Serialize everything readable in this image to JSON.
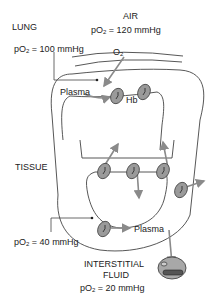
{
  "diagram": {
    "labels": {
      "lung": "LUNG",
      "air": "AIR",
      "air_po2_prefix": "pO",
      "air_po2_sub": "2",
      "air_po2_value": " = 120 mmHg",
      "lung_po2_prefix": "pO",
      "lung_po2_sub": "2",
      "lung_po2_value": " = 100 mmHg",
      "o2_prefix": "O",
      "o2_sub": "2",
      "plasma_top": "Plasma",
      "hb": "Hb",
      "tissue": "TISSUE",
      "tissue_po2_prefix": "pO",
      "tissue_po2_sub": "2",
      "tissue_po2_value": " = 40 mmHg",
      "plasma_bottom": "Plasma",
      "interstitial_line1": "INTERSTITIAL",
      "interstitial_line2": "FLUID",
      "interstitial_po2_prefix": "pO",
      "interstitial_po2_sub": "2",
      "interstitial_po2_value": " = 20 mmHg"
    },
    "colors": {
      "line": "#444444",
      "arrow": "#8a8a8a",
      "cell_fill": "#9a9a9a",
      "cell_dark": "#555555"
    }
  }
}
